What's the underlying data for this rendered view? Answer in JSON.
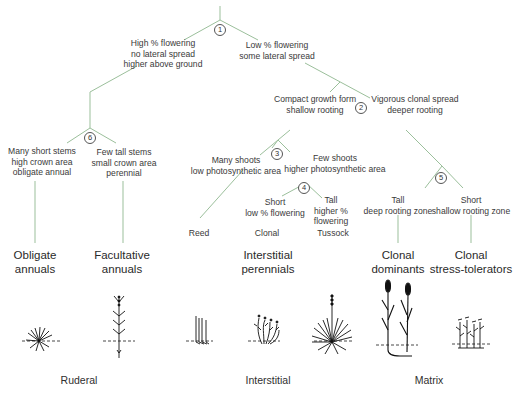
{
  "diagram": {
    "line_color": "#9bbf9b",
    "decisions": [
      {
        "id": 1,
        "label": "1"
      },
      {
        "id": 2,
        "label": "2"
      },
      {
        "id": 3,
        "label": "3"
      },
      {
        "id": 4,
        "label": "4"
      },
      {
        "id": 5,
        "label": "5"
      },
      {
        "id": 6,
        "label": "6"
      }
    ],
    "branches": {
      "b1_left": [
        "High % flowering",
        "no lateral spread",
        "higher above ground"
      ],
      "b1_right": [
        "Low % flowering",
        "some lateral spread"
      ],
      "b2_left": [
        "Compact growth form",
        "shallow rooting"
      ],
      "b2_right": [
        "Vigorous clonal spread",
        "deeper rooting"
      ],
      "b3_left": [
        "Many shoots",
        "low photosynthetic area"
      ],
      "b3_right": [
        "Few shoots",
        "higher photosynthetic area"
      ],
      "b4_left": [
        "Short",
        "low % flowering"
      ],
      "b4_right": [
        "Tall",
        "higher %",
        "flowering"
      ],
      "b5_left": [
        "Tall",
        "deep rooting zone"
      ],
      "b5_right": [
        "Short",
        "shallow rooting zone"
      ],
      "b6_left": [
        "Many short stems",
        "high crown area",
        "obligate annual"
      ],
      "b6_right": [
        "Few tall stems",
        "small crown area",
        "perennial"
      ]
    },
    "leaves": [
      "Reed",
      "Clonal",
      "Tussock"
    ],
    "categories": [
      [
        "Obligate",
        "annuals"
      ],
      [
        "Facultative",
        "annuals"
      ],
      [
        "Interstitial",
        "perennials"
      ],
      [
        "Clonal",
        "dominants"
      ],
      [
        "Clonal",
        "stress-tolerators"
      ]
    ],
    "groups": [
      "Ruderal",
      "Interstitial",
      "Matrix"
    ],
    "icons": [
      "rosette-plant-icon",
      "tall-branched-plant-icon",
      "reed-stems-icon",
      "clonal-bush-icon",
      "tussock-plant-icon",
      "cattail-plant-icon",
      "short-clonal-plant-icon"
    ]
  }
}
